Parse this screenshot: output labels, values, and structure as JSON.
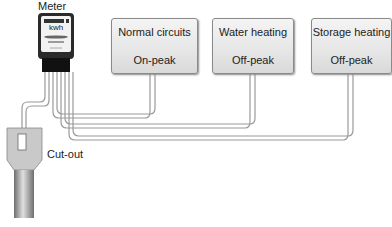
{
  "meter": {
    "label": "Meter",
    "unit": "kwh"
  },
  "cutout": {
    "label": "Cut-out"
  },
  "circuits": [
    {
      "name": "Normal circuits",
      "tariff": "On-peak"
    },
    {
      "name": "Water heating",
      "tariff": "Off-peak"
    },
    {
      "name": "Storage heating",
      "tariff": "Off-peak"
    }
  ],
  "colors": {
    "wire": "#9a9a9a",
    "meter_body": "#222222",
    "cable": "#8c8c8c"
  }
}
